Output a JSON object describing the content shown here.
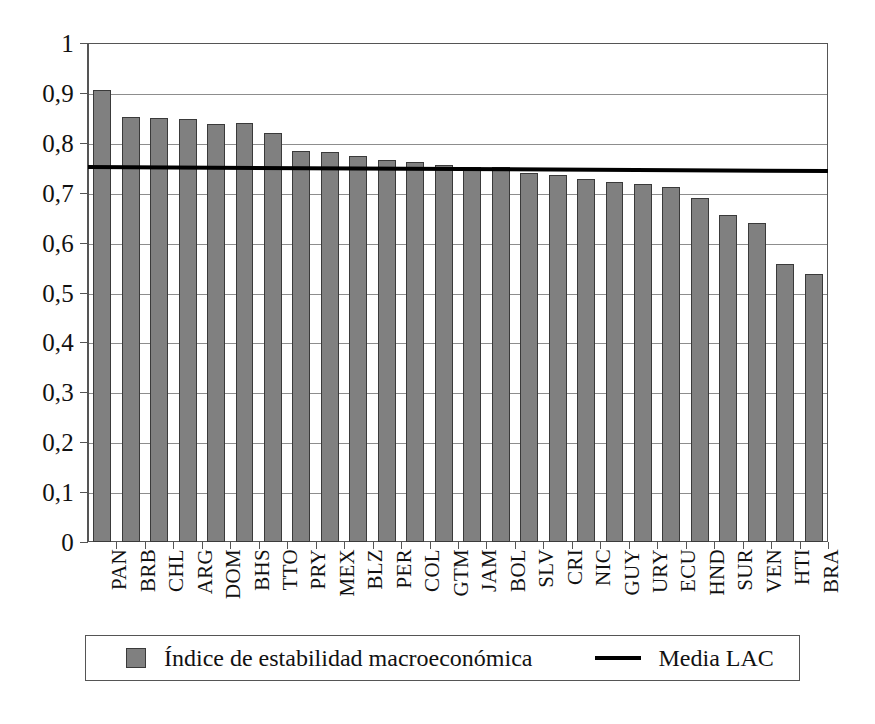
{
  "chart_data": {
    "type": "bar",
    "title": "",
    "subtitle": "",
    "xlabel": "",
    "ylabel": "",
    "ylim": [
      0,
      1
    ],
    "ytick_labels": [
      "0",
      "0,1",
      "0,2",
      "0,3",
      "0,4",
      "0,5",
      "0,6",
      "0,7",
      "0,8",
      "0,9",
      "1"
    ],
    "ytick_values": [
      0,
      0.1,
      0.2,
      0.3,
      0.4,
      0.5,
      0.6,
      0.7,
      0.8,
      0.9,
      1
    ],
    "grid": true,
    "grid_axis": "y",
    "legend_position": "bottom",
    "decimal_separator": ",",
    "categories": [
      "PAN",
      "BRB",
      "CHL",
      "ARG",
      "DOM",
      "BHS",
      "TTO",
      "PRY",
      "MEX",
      "BLZ",
      "PER",
      "COL",
      "GTM",
      "JAM",
      "BOL",
      "SLV",
      "CRI",
      "NIC",
      "GUY",
      "URY",
      "ECU",
      "HND",
      "SUR",
      "VEN",
      "HTI",
      "BRA"
    ],
    "series": [
      {
        "name": "Índice de estabilidad macroeconómica",
        "type": "bar",
        "color": "#808080",
        "edge_color": "#3a3a3a",
        "values": [
          0.905,
          0.852,
          0.85,
          0.848,
          0.838,
          0.84,
          0.82,
          0.783,
          0.781,
          0.773,
          0.766,
          0.762,
          0.756,
          0.751,
          0.751,
          0.739,
          0.735,
          0.728,
          0.721,
          0.717,
          0.712,
          0.69,
          0.655,
          0.64,
          0.558,
          0.538
        ]
      },
      {
        "name": "Media LAC",
        "type": "line",
        "color": "#000000",
        "value_start": 0.756,
        "value_end": 0.748,
        "value": 0.752
      }
    ],
    "legend": [
      {
        "label": "Índice de estabilidad macroeconómica",
        "marker": "square",
        "color": "#808080"
      },
      {
        "label": "Media LAC",
        "marker": "line",
        "color": "#000000"
      }
    ]
  },
  "colors": {
    "bar_fill": "#808080",
    "bar_edge": "#3a3a3a",
    "mean_line": "#000000",
    "frame": "#555555",
    "gridline": "#8d8d8d",
    "background": "#ffffff"
  }
}
